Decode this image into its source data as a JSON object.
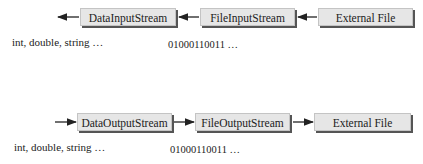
{
  "input_row": {
    "boxes": [
      {
        "label": "DataInputStream"
      },
      {
        "label": "FileInputStream"
      },
      {
        "label": "External File"
      }
    ],
    "data_label": "int, double, string …",
    "bits_label": "01000110011 …",
    "direction": "right-to-left"
  },
  "output_row": {
    "boxes": [
      {
        "label": "DataOutputStream"
      },
      {
        "label": "FileOutputStream"
      },
      {
        "label": "External File"
      }
    ],
    "data_label": "int, double, string …",
    "bits_label": "01000110011 …",
    "direction": "left-to-right"
  },
  "colors": {
    "box_fill": "#e6e6e6",
    "box_shadow": "#555555",
    "arrow": "#222222"
  }
}
